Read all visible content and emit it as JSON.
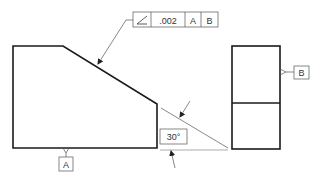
{
  "feature_control_frame": {
    "symbol": "angularity-icon",
    "tolerance": ".002",
    "datum_primary": "A",
    "datum_secondary": "B"
  },
  "datum_a": {
    "label": "A"
  },
  "datum_b": {
    "label": "B"
  },
  "angle_dimension": {
    "label": "30°"
  },
  "colors": {
    "line": "#1a1a1a",
    "thin": "#555555",
    "background": "#ffffff"
  }
}
